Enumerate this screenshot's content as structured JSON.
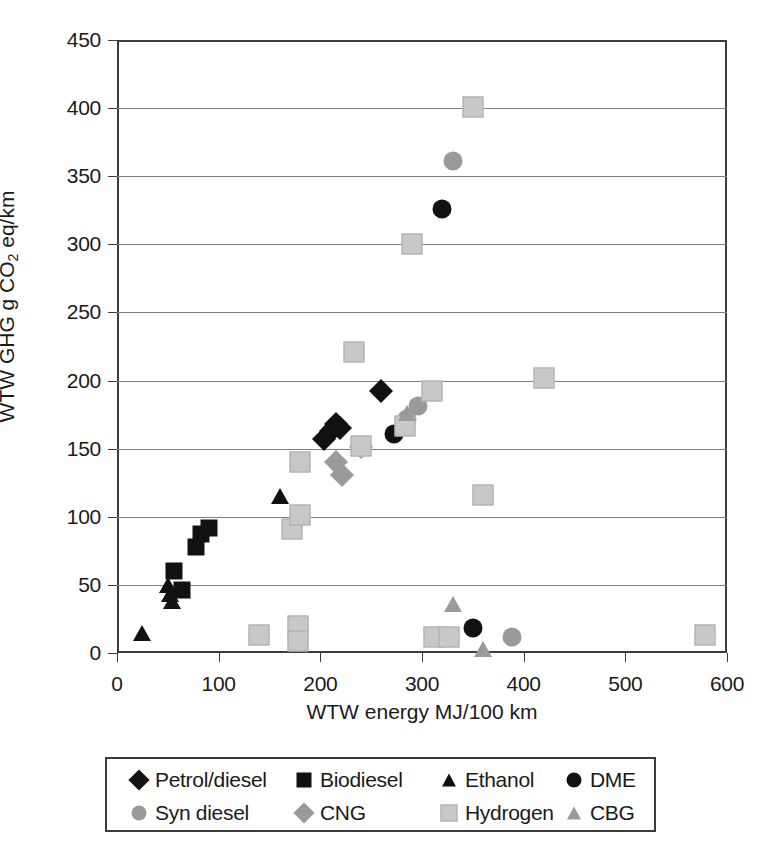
{
  "chart_data": {
    "type": "scatter",
    "title": "",
    "xlabel": "WTW energy MJ/100 km",
    "ylabel": "WTW GHG g CO2 eq/km",
    "ylabel_parts": {
      "pre": "WTW GHG g CO",
      "sub": "2",
      "post": " eq/km"
    },
    "xlim": [
      0,
      600
    ],
    "ylim": [
      0,
      450
    ],
    "xticks": [
      0,
      100,
      200,
      300,
      400,
      500,
      600
    ],
    "yticks": [
      0,
      50,
      100,
      150,
      200,
      250,
      300,
      350,
      400,
      450
    ],
    "grid": "horizontal",
    "legend_position": "below-axes",
    "series": [
      {
        "name": "Petrol/diesel",
        "marker": "diamond",
        "color": "#111111",
        "size": 17,
        "points": [
          {
            "x": 204,
            "y": 157
          },
          {
            "x": 210,
            "y": 163
          },
          {
            "x": 215,
            "y": 168
          },
          {
            "x": 219,
            "y": 165
          },
          {
            "x": 260,
            "y": 192
          }
        ]
      },
      {
        "name": "Biodiesel",
        "marker": "square",
        "color": "#111111",
        "size": 17,
        "points": [
          {
            "x": 56,
            "y": 60
          },
          {
            "x": 64,
            "y": 46
          },
          {
            "x": 78,
            "y": 78
          },
          {
            "x": 83,
            "y": 87
          },
          {
            "x": 90,
            "y": 92
          }
        ]
      },
      {
        "name": "Ethanol",
        "marker": "triangle",
        "color": "#111111",
        "size": 19,
        "points": [
          {
            "x": 25,
            "y": 15
          },
          {
            "x": 50,
            "y": 50
          },
          {
            "x": 52,
            "y": 43
          },
          {
            "x": 54,
            "y": 38
          },
          {
            "x": 160,
            "y": 115
          }
        ]
      },
      {
        "name": "DME",
        "marker": "circle",
        "color": "#111111",
        "size": 19,
        "points": [
          {
            "x": 272,
            "y": 161
          },
          {
            "x": 320,
            "y": 326
          },
          {
            "x": 350,
            "y": 18
          }
        ]
      },
      {
        "name": "Syn diesel",
        "marker": "circle",
        "color": "#9a9a9a",
        "size": 19,
        "points": [
          {
            "x": 285,
            "y": 172
          },
          {
            "x": 296,
            "y": 181
          },
          {
            "x": 330,
            "y": 361
          },
          {
            "x": 389,
            "y": 12
          }
        ]
      },
      {
        "name": "CNG",
        "marker": "diamond",
        "color": "#9a9a9a",
        "size": 17,
        "points": [
          {
            "x": 215,
            "y": 140
          },
          {
            "x": 221,
            "y": 131
          },
          {
            "x": 240,
            "y": 151
          }
        ]
      },
      {
        "name": "Hydrogen",
        "marker": "square",
        "color": "#c8c8c8",
        "size": 19,
        "points": [
          {
            "x": 140,
            "y": 13
          },
          {
            "x": 178,
            "y": 20
          },
          {
            "x": 178,
            "y": 9
          },
          {
            "x": 172,
            "y": 91
          },
          {
            "x": 180,
            "y": 101
          },
          {
            "x": 180,
            "y": 140
          },
          {
            "x": 233,
            "y": 221
          },
          {
            "x": 240,
            "y": 152
          },
          {
            "x": 283,
            "y": 167
          },
          {
            "x": 290,
            "y": 300
          },
          {
            "x": 310,
            "y": 192
          },
          {
            "x": 312,
            "y": 12
          },
          {
            "x": 327,
            "y": 12
          },
          {
            "x": 350,
            "y": 401
          },
          {
            "x": 360,
            "y": 116
          },
          {
            "x": 420,
            "y": 202
          },
          {
            "x": 578,
            "y": 13
          }
        ]
      },
      {
        "name": "CBG",
        "marker": "triangle",
        "color": "#9a9a9a",
        "size": 19,
        "points": [
          {
            "x": 285,
            "y": 176
          },
          {
            "x": 330,
            "y": 36
          },
          {
            "x": 360,
            "y": 3
          }
        ]
      }
    ]
  },
  "legend": {
    "row1": [
      {
        "label": "Petrol/diesel",
        "marker": "diamond",
        "color": "#111111"
      },
      {
        "label": "Biodiesel",
        "marker": "square",
        "color": "#111111"
      },
      {
        "label": "Ethanol",
        "marker": "triangle",
        "color": "#111111"
      },
      {
        "label": "DME",
        "marker": "circle",
        "color": "#111111"
      }
    ],
    "row2": [
      {
        "label": "Syn diesel",
        "marker": "circle",
        "color": "#9a9a9a"
      },
      {
        "label": "CNG",
        "marker": "diamond",
        "color": "#9a9a9a"
      },
      {
        "label": "Hydrogen",
        "marker": "square",
        "color": "#c8c8c8"
      },
      {
        "label": "CBG",
        "marker": "triangle",
        "color": "#9a9a9a"
      }
    ]
  },
  "colors": {
    "axis": "#3c3c3c",
    "grid": "#808080",
    "black_series": "#111111",
    "mid_grey_series": "#9a9a9a",
    "light_grey_series": "#c8c8c8",
    "background": "#ffffff"
  }
}
